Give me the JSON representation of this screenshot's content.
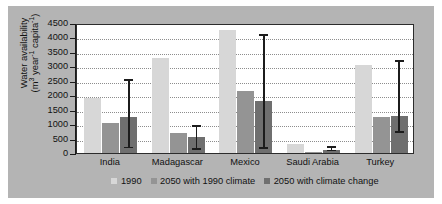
{
  "chart_data": {
    "type": "bar",
    "title": "",
    "xlabel": "",
    "ylabel_line1": "Water availability",
    "ylabel_line2_pre": "(m",
    "ylabel_line2_sup1": "3",
    "ylabel_line2_mid": " year",
    "ylabel_line2_sup2": "-1",
    "ylabel_line2_mid2": " capita",
    "ylabel_line2_sup3": "-1",
    "ylabel_line2_end": ")",
    "categories": [
      "India",
      "Madagascar",
      "Mexico",
      "Saudi Arabia",
      "Turkey"
    ],
    "ylim": [
      0,
      4500
    ],
    "yticks": [
      0,
      500,
      1000,
      1500,
      2000,
      2500,
      3000,
      3500,
      4000,
      4500
    ],
    "ytick_labels": [
      "0",
      "500",
      "1000",
      "1500",
      "2000",
      "2500",
      "3000",
      "3500",
      "4000",
      "4500"
    ],
    "grid": true,
    "legend_position": "bottom",
    "series": [
      {
        "name": "1990",
        "color": "#d7d7d7",
        "values": [
          1900,
          3300,
          4250,
          300,
          3050
        ],
        "errors": [
          null,
          null,
          null,
          null,
          null
        ]
      },
      {
        "name": "2050 with 1990 climate",
        "color": "#949494",
        "values": [
          1050,
          680,
          2150,
          50,
          1230
        ],
        "errors": [
          null,
          null,
          null,
          null,
          null
        ]
      },
      {
        "name": "2050 with climate change",
        "color": "#6f6f6f",
        "values": [
          1250,
          570,
          1800,
          100,
          1280
        ],
        "errors": [
          {
            "low": 170,
            "high": 2500
          },
          {
            "low": 120,
            "high": 900
          },
          {
            "low": 150,
            "high": 4050
          },
          {
            "low": 60,
            "high": 180
          },
          {
            "low": 700,
            "high": 3150
          }
        ]
      }
    ]
  }
}
